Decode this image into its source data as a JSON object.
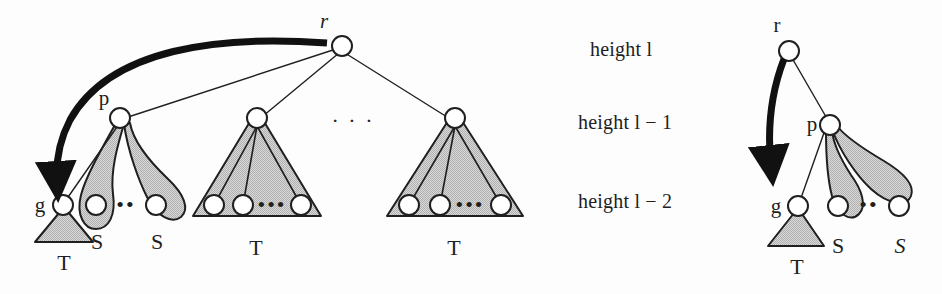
{
  "figure": {
    "background_color": "#fdfdfd",
    "ink_color": "#1f1f1f",
    "fill_gray": "#c9c9c9",
    "node_fill": "#ffffff"
  },
  "height_labels": {
    "top": "height l",
    "middle": "height l − 1",
    "bottom": "height l − 2"
  },
  "left_diagram": {
    "root_label": "r",
    "parent_label": "p",
    "grandchild_label": "g",
    "ellipsis": "· · ·",
    "subtree_dots": "•••",
    "lobe_dots": "••",
    "labels": {
      "t_under_g": "T",
      "s_first": "S",
      "s_second": "S",
      "t_middle": "T",
      "t_right": "T"
    }
  },
  "right_diagram": {
    "root_label": "r",
    "parent_label": "p",
    "grandchild_label": "g",
    "lobe_dots": "••",
    "labels": {
      "t_under_g": "T",
      "s_first": "S",
      "s_second": "S"
    }
  }
}
